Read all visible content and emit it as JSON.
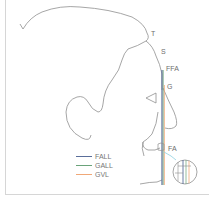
{
  "diagram": {
    "landmarks": [
      {
        "id": "T",
        "label": "T"
      },
      {
        "id": "S",
        "label": "S"
      },
      {
        "id": "FFA",
        "label": "FFA"
      },
      {
        "id": "G",
        "label": "G"
      },
      {
        "id": "FA",
        "label": "FA"
      }
    ],
    "legend": [
      {
        "label": "FALL",
        "color": "#5a6e9a"
      },
      {
        "label": "GALL",
        "color": "#6aa37a"
      },
      {
        "label": "GVL",
        "color": "#f0a878"
      }
    ],
    "colors": {
      "outline": "#8f8f8f",
      "tooth_highlight": "#8fd0e0",
      "frame": "#d6d6d6"
    }
  }
}
